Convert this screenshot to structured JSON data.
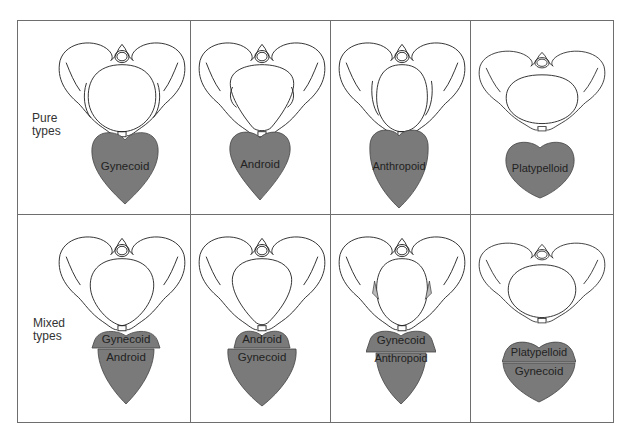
{
  "rows": [
    {
      "label_line1": "Pure",
      "label_line2": "types"
    },
    {
      "label_line1": "Mixed",
      "label_line2": "types"
    }
  ],
  "pure": [
    {
      "type": "Gynecoid"
    },
    {
      "type": "Android"
    },
    {
      "type": "Anthropoid"
    },
    {
      "type": "Platypelloid"
    }
  ],
  "mixed": [
    {
      "top": "Gynecoid",
      "bottom": "Android"
    },
    {
      "top": "Android",
      "bottom": "Gynecoid"
    },
    {
      "top": "Gynecoid",
      "bottom": "Anthropoid"
    },
    {
      "top": "Platypelloid",
      "bottom": "Gynecoid"
    }
  ],
  "colors": {
    "heart_fill": "#7a7a7a",
    "heart_stroke": "#444444",
    "grid": "#6e6e6e",
    "line": "#222222"
  }
}
